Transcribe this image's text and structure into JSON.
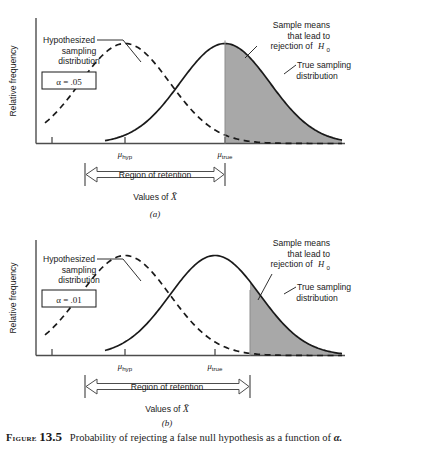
{
  "figure": {
    "label": "Figure",
    "number": "13.5",
    "caption": "Probability of rejecting a false null hypothesis as a function of",
    "caption_symbol": "α.",
    "colors": {
      "shaded_region": "#a8a8a8",
      "curve": "#1a1a1a",
      "axis": "#4d4d4d"
    }
  },
  "panels": [
    {
      "id": "a",
      "panel_label": "(a)",
      "alpha_box": "α = .05",
      "y_axis_label": "Relative frequency",
      "x_axis_label_prefix": "Values of ",
      "x_axis_label_symbol": "X̄",
      "tick_labels": [
        {
          "name": "mu-hyp",
          "base": "μ",
          "sub": "hyp"
        },
        {
          "name": "mu-true",
          "base": "μ",
          "sub": "true"
        }
      ],
      "annotations": {
        "hypothesized": [
          "Hypothesized",
          "sampling",
          "distribution"
        ],
        "sample_means": [
          "Sample means",
          "that lead to",
          "rejection of"
        ],
        "sample_means_symbol": "H",
        "sample_means_symbol_sub": "0",
        "true_sampling": [
          "True sampling",
          "distribution"
        ]
      },
      "region_label": "Region of retention",
      "chart_geometry": {
        "hyp_mean_x": 125,
        "true_mean_x": 225,
        "critical_x": 225,
        "retention_left_x": 85,
        "retention_right_x": 225
      }
    },
    {
      "id": "b",
      "panel_label": "(b)",
      "alpha_box": "α = .01",
      "y_axis_label": "Relative frequency",
      "x_axis_label_prefix": "Values of ",
      "x_axis_label_symbol": "X̄",
      "tick_labels": [
        {
          "name": "mu-hyp",
          "base": "μ",
          "sub": "hyp"
        },
        {
          "name": "mu-true",
          "base": "μ",
          "sub": "true"
        }
      ],
      "annotations": {
        "hypothesized": [
          "Hypothesized",
          "sampling",
          "distribution"
        ],
        "sample_means": [
          "Sample means",
          "that lead to",
          "rejection of"
        ],
        "sample_means_symbol": "H",
        "sample_means_symbol_sub": "0",
        "true_sampling": [
          "True sampling",
          "distribution"
        ]
      },
      "region_label": "Region of retention",
      "chart_geometry": {
        "hyp_mean_x": 125,
        "true_mean_x": 215,
        "critical_x": 250,
        "retention_left_x": 85,
        "retention_right_x": 250
      }
    }
  ],
  "chart_data": [
    {
      "type": "area",
      "title": "(a) alpha = .05",
      "xlabel": "Values of X̄",
      "ylabel": "Relative frequency",
      "grid": false,
      "legend": "annotations",
      "series": [
        {
          "name": "Hypothesized sampling distribution",
          "style": "dashed",
          "mean": 125,
          "sd": 45,
          "peak_height": 100
        },
        {
          "name": "True sampling distribution",
          "style": "solid",
          "mean": 225,
          "sd": 45,
          "peak_height": 100,
          "shaded_from": 225,
          "shaded_label": "Sample means that lead to rejection of H0"
        }
      ],
      "markers": [
        {
          "label": "μ_hyp",
          "x": 125
        },
        {
          "label": "μ_true",
          "x": 225
        }
      ],
      "annotations": [
        {
          "text": "Region of retention",
          "from_x": 85,
          "to_x": 225
        },
        {
          "text": "α = .05"
        }
      ]
    },
    {
      "type": "area",
      "title": "(b) alpha = .01",
      "xlabel": "Values of X̄",
      "ylabel": "Relative frequency",
      "grid": false,
      "legend": "annotations",
      "series": [
        {
          "name": "Hypothesized sampling distribution",
          "style": "dashed",
          "mean": 125,
          "sd": 45,
          "peak_height": 100
        },
        {
          "name": "True sampling distribution",
          "style": "solid",
          "mean": 215,
          "sd": 45,
          "peak_height": 100,
          "shaded_from": 250,
          "shaded_label": "Sample means that lead to rejection of H0"
        }
      ],
      "markers": [
        {
          "label": "μ_hyp",
          "x": 125
        },
        {
          "label": "μ_true",
          "x": 215
        }
      ],
      "annotations": [
        {
          "text": "Region of retention",
          "from_x": 85,
          "to_x": 250
        },
        {
          "text": "α = .01"
        }
      ]
    }
  ]
}
